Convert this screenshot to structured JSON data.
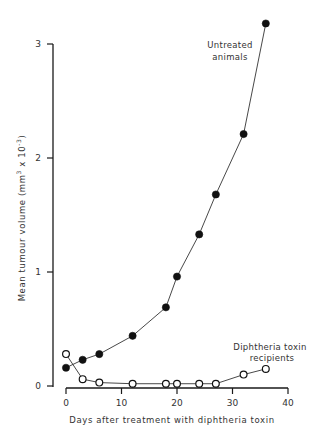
{
  "chart_data": {
    "type": "line",
    "title": "",
    "xlabel": "Days after treatment with diphtheria toxin",
    "ylabel": "Mean tumour volume (mm³ x 10⁻³)",
    "xlim": [
      0,
      40
    ],
    "ylim": [
      0,
      3.2
    ],
    "xticks": [
      0,
      10,
      20,
      30,
      40
    ],
    "xtick_labels": [
      "0",
      "10",
      "20",
      "30",
      "40"
    ],
    "yticks": [
      0,
      1,
      2,
      3
    ],
    "ytick_labels": [
      "0",
      "1",
      "2",
      "3"
    ],
    "grid": false,
    "legend": "inline annotations",
    "series": [
      {
        "name": "Untreated animals",
        "marker": "filled-circle",
        "x": [
          0,
          3,
          6,
          12,
          18,
          20,
          24,
          27,
          32,
          36
        ],
        "values": [
          0.16,
          0.23,
          0.28,
          0.44,
          0.69,
          0.96,
          1.33,
          1.68,
          2.21,
          3.18
        ]
      },
      {
        "name": "Diphtheria toxin recipients",
        "marker": "open-circle",
        "x": [
          0,
          3,
          6,
          12,
          18,
          20,
          24,
          27,
          32,
          36
        ],
        "values": [
          0.28,
          0.06,
          0.03,
          0.02,
          0.02,
          0.02,
          0.02,
          0.02,
          0.1,
          0.15
        ]
      }
    ],
    "annotations": [
      {
        "text_lines": [
          "Untreated",
          "animals"
        ],
        "series": "Untreated animals"
      },
      {
        "text_lines": [
          "Diphtheria toxin",
          "recipients"
        ],
        "series": "Diphtheria toxin recipients"
      }
    ]
  },
  "labels": {
    "xlabel": "Days after treatment with diphtheria toxin",
    "ylabel_main": "Mean tumour volume  (mm",
    "ylabel_sup1": "3",
    "ylabel_mid": " x 10",
    "ylabel_sup2": "-3",
    "ylabel_end": ")",
    "annot_untreated_1": "Untreated",
    "annot_untreated_2": "animals",
    "annot_dt_1": "Diphtheria toxin",
    "annot_dt_2": "recipients"
  },
  "colors": {
    "axis": "#1a1a1a",
    "line": "#333333",
    "marker_fill_filled": "#111111",
    "marker_fill_open": "#ffffff",
    "background": "#ffffff"
  }
}
